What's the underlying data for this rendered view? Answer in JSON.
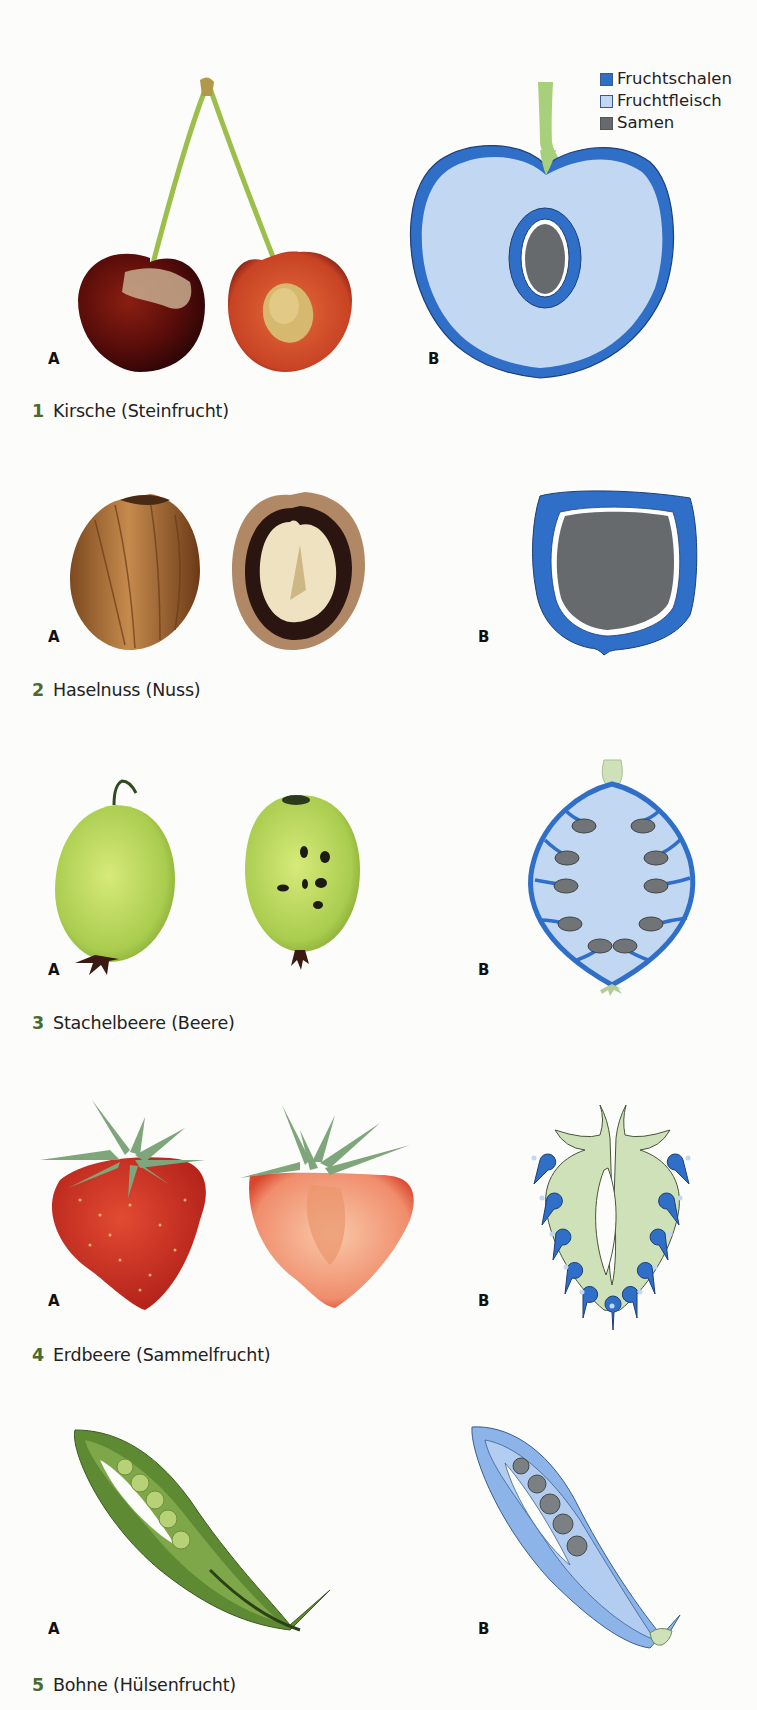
{
  "legend": {
    "items": [
      {
        "label": "Fruchtschalen",
        "color": "#2f6fc8"
      },
      {
        "label": "Fruchtfleisch",
        "color": "#c2d8f2"
      },
      {
        "label": "Samen",
        "color": "#666a6c"
      }
    ]
  },
  "panel_labels": {
    "a": "A",
    "b": "B"
  },
  "figures": [
    {
      "number": "1",
      "title": "Kirsche (Steinfrucht)",
      "photo": "cherry-photo",
      "diagram": "cherry-diagram"
    },
    {
      "number": "2",
      "title": "Haselnuss (Nuss)",
      "photo": "hazelnut-photo",
      "diagram": "hazelnut-diagram"
    },
    {
      "number": "3",
      "title": "Stachelbeere (Beere)",
      "photo": "gooseberry-photo",
      "diagram": "gooseberry-diagram"
    },
    {
      "number": "4",
      "title": "Erdbeere (Sammelfrucht)",
      "photo": "strawberry-photo",
      "diagram": "strawberry-diagram"
    },
    {
      "number": "5",
      "title": "Bohne (Hülsenfrucht)",
      "photo": "bean-photo",
      "diagram": "bean-diagram"
    }
  ],
  "colors": {
    "fruchtschalen": "#2f6fc8",
    "fruchtfleisch": "#c2d8f2",
    "samen": "#666a6c",
    "caption_number": "#4b6b2e",
    "strawberry_flesh": "#cfe1b8"
  }
}
